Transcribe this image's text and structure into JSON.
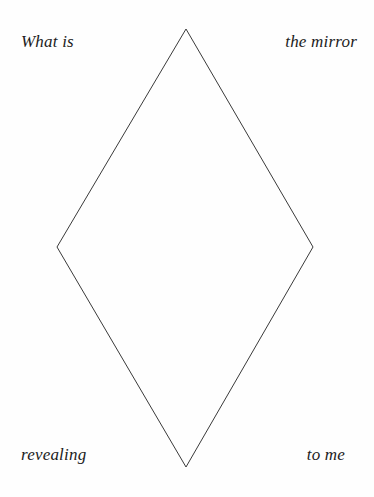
{
  "canvas": {
    "width": 374,
    "height": 497,
    "background_color": "#fefefe"
  },
  "shape": {
    "name": "diamond",
    "type": "rhombus",
    "stroke_color": "#3a3a3a",
    "stroke_width": 1,
    "fill": "none",
    "vertices": {
      "top": {
        "x": 186,
        "y": 29
      },
      "right": {
        "x": 313,
        "y": 247
      },
      "bottom": {
        "x": 186,
        "y": 467
      },
      "left": {
        "x": 57,
        "y": 247
      }
    },
    "points": "186,29 313,247 186,467 57,247"
  },
  "labels": {
    "top_left": "What is",
    "top_right": "the mirror",
    "bottom_left": "revealing",
    "bottom_right": "to me",
    "full_sentence": "What is the mirror revealing to me",
    "text_color": "#1c1c1c",
    "style": "italic serif"
  }
}
